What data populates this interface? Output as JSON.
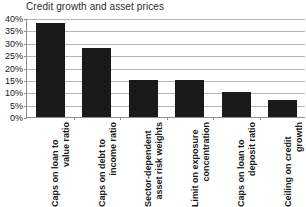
{
  "chart_data": {
    "type": "bar",
    "title": "Credit growth and asset prices",
    "xlabel": "",
    "ylabel": "",
    "ylim": [
      0,
      40
    ],
    "ytick_values": [
      0,
      5,
      10,
      15,
      20,
      25,
      30,
      35,
      40
    ],
    "ytick_labels": [
      "0%",
      "5%",
      "10%",
      "15%",
      "20%",
      "25%",
      "30%",
      "35%",
      "40%"
    ],
    "grid": true,
    "legend": false,
    "bar_color": "#1a1a1a",
    "grid_color": "#b5b5b5",
    "axis_color": "#8e8e8e",
    "categories": [
      "Caps on loan to value ratio",
      "Caps on debt to income ratio",
      "Sector-dependent asset risk weights",
      "Limit on exposure concentration",
      "Caps on loan to deposit ratio",
      "Ceiling on credit growth"
    ],
    "category_lines": [
      [
        "Caps on loan to",
        "value ratio"
      ],
      [
        "Caps on debt to",
        "income ratio"
      ],
      [
        "Sector-dependent",
        "asset risk weights"
      ],
      [
        "Limit on exposure",
        "concentration"
      ],
      [
        "Caps on loan to",
        "deposit ratio"
      ],
      [
        "Ceiling on credit",
        "growth"
      ]
    ],
    "values": [
      38,
      28,
      15,
      15,
      10,
      7
    ],
    "value_labels": [
      "38%",
      "28%",
      "15%",
      "15%",
      "10%",
      "7%"
    ]
  }
}
